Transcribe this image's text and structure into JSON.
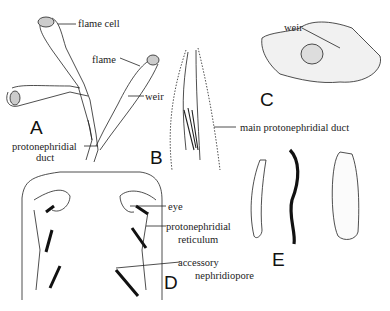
{
  "panels": {
    "A": {
      "letter": "A",
      "labels": {
        "flame_cell": "flame cell",
        "duct1": "protonephridial",
        "duct2": "duct"
      }
    },
    "B": {
      "letter": "B",
      "labels": {
        "flame": "flame",
        "weir": "weir",
        "main_duct": "main protonephridial duct"
      }
    },
    "C": {
      "letter": "C",
      "labels": {
        "weir": "weir"
      }
    },
    "D": {
      "letter": "D",
      "labels": {
        "eye": "eye",
        "ret1": "protonephridial",
        "ret2": "reticulum",
        "acc1": "accessory",
        "acc2": "nephridiopore"
      }
    },
    "E": {
      "letter": "E"
    }
  }
}
